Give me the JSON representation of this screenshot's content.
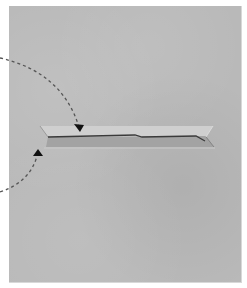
{
  "diagram": {
    "colors": {
      "background": "#ffffff",
      "paper": "#b9b9b9",
      "slit_upper_band": "#cfcfcf",
      "slit_lower_band": "#9e9e9e",
      "crease_line": "#3a3a3a",
      "arrow": "#555555",
      "arrowhead": "#111111"
    },
    "paper": {
      "x": 9,
      "y": 6,
      "width": 232,
      "height": 276
    },
    "slit": {
      "upper_band": {
        "x1": 40,
        "x2": 213,
        "y_top": 126,
        "y_bottom": 137
      },
      "lower_band": {
        "x1": 46,
        "x2": 214,
        "y_top": 137,
        "y_bottom": 147
      },
      "crease": [
        [
          48,
          137
        ],
        [
          135,
          135
        ],
        [
          142,
          137
        ],
        [
          196,
          136
        ],
        [
          205,
          141
        ]
      ]
    },
    "arrows": [
      {
        "name": "upper-arrow",
        "start": [
          0,
          58
        ],
        "control": [
          60,
          70
        ],
        "end": [
          79,
          130
        ],
        "points_to": "upper edge of slit"
      },
      {
        "name": "lower-arrow",
        "start": [
          0,
          192
        ],
        "control": [
          32,
          180
        ],
        "end": [
          38,
          152
        ],
        "points_to": "lower edge of slit"
      }
    ]
  }
}
